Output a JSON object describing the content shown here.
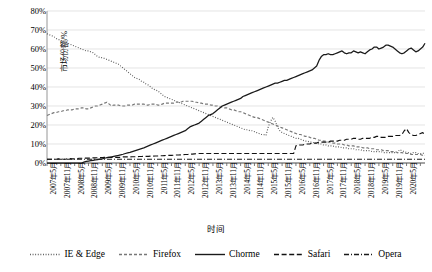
{
  "chart_data": {
    "type": "line",
    "title": "",
    "xlabel": "时间",
    "ylabel": "市场份额/%",
    "ylim": [
      0,
      80
    ],
    "ytick_labels": [
      "0%",
      "10%",
      "20%",
      "30%",
      "40%",
      "50%",
      "60%",
      "70%",
      "80%"
    ],
    "ytick_values": [
      0,
      10,
      20,
      30,
      40,
      50,
      60,
      70,
      80
    ],
    "grid": true,
    "legend_position": "bottom",
    "x_start": "2007年5月",
    "x_end": "2020年5月",
    "x_tick_interval_months": 6,
    "x_tick_labels": [
      "2007年5月",
      "2007年11月",
      "2008年5月",
      "2008年11月",
      "2009年5月",
      "2009年11月",
      "2010年5月",
      "2010年11月",
      "2011年5月",
      "2011年11月",
      "2012年5月",
      "2012年11月",
      "2013年5月",
      "2013年11月",
      "2014年5月",
      "2014年11月",
      "2015年5月",
      "2015年11月",
      "2016年5月",
      "2016年11月",
      "2017年5月",
      "2017年11月",
      "2018年5月",
      "2018年11月",
      "2019年5月",
      "2019年11月",
      "2020年5月"
    ],
    "series": [
      {
        "name": "IE & Edge",
        "style": "dotted",
        "color": "#555555",
        "values": [
          68,
          67.5,
          67,
          66.5,
          65.5,
          65,
          64.5,
          64,
          63.5,
          63,
          62.5,
          62,
          61.5,
          61,
          60.5,
          60,
          59.5,
          59,
          59,
          58.5,
          58,
          57,
          56,
          55.5,
          55.5,
          55,
          54.5,
          54,
          53.5,
          53,
          52.5,
          52,
          51,
          50,
          49,
          48,
          47,
          46,
          45,
          44.5,
          44,
          43,
          42.5,
          41.5,
          41,
          40,
          39,
          38.5,
          38,
          37,
          36,
          35,
          34.5,
          34,
          33.5,
          33,
          32.5,
          32,
          31.5,
          31,
          30.5,
          30,
          29.5,
          29,
          28.5,
          28,
          27.5,
          27,
          26.5,
          26,
          25.5,
          25,
          24.5,
          24,
          23.5,
          23,
          22.5,
          22,
          21.5,
          21,
          20.5,
          20,
          19.5,
          19,
          18.5,
          18,
          17.5,
          17.5,
          17,
          17,
          16.5,
          16,
          15.5,
          15,
          15,
          14.5,
          19,
          22,
          24,
          22,
          19,
          17,
          16,
          15.5,
          15,
          14.5,
          14,
          13.5,
          13,
          13,
          12.5,
          12,
          11.5,
          11.5,
          11,
          11,
          10.5,
          10.5,
          10,
          10,
          9.5,
          9.5,
          9,
          9,
          9,
          8.5,
          8.5,
          8.5,
          8,
          8,
          8,
          7.5,
          7.5,
          7.5,
          7,
          7,
          7,
          6.5,
          6.5,
          6.5,
          6.5,
          6,
          6,
          6,
          6,
          6,
          5.5,
          5.5,
          5.5,
          5.5,
          5.5,
          5.5,
          5.5,
          7,
          6.5,
          6,
          5.5,
          5.5,
          5,
          5.5,
          5.5,
          5,
          5,
          5,
          5.5
        ]
      },
      {
        "name": "Firefox",
        "style": "dashed-short",
        "color": "#777777",
        "values": [
          25,
          25.5,
          26,
          26.5,
          26.5,
          27,
          27,
          27.5,
          27.5,
          28,
          28,
          28,
          28.5,
          28.5,
          28.5,
          29,
          29,
          28.5,
          28.5,
          29,
          29.5,
          30,
          30,
          30.5,
          31,
          31.5,
          32,
          31,
          30,
          30.5,
          30.5,
          30.5,
          30,
          30,
          30,
          30.5,
          30.5,
          30.5,
          31,
          31,
          31,
          31,
          31,
          30.5,
          30.5,
          31,
          31,
          31,
          30.5,
          30.5,
          31,
          31.5,
          31.5,
          31.5,
          31.5,
          31.5,
          32,
          32,
          32,
          32.5,
          32.5,
          32.5,
          32.5,
          32.5,
          32,
          32,
          31.5,
          31.5,
          31,
          31,
          31,
          30.5,
          30.5,
          30,
          30,
          29.5,
          29.5,
          29,
          29,
          28.5,
          28,
          28,
          27.5,
          27,
          27,
          26.5,
          26,
          25.5,
          25,
          24.5,
          24,
          24,
          23.5,
          23,
          22.5,
          22,
          21.5,
          21,
          20.5,
          20,
          19.5,
          19,
          18.5,
          18,
          17.5,
          17,
          16.5,
          16,
          15.5,
          15,
          15,
          14.5,
          14,
          14,
          13.5,
          13,
          13,
          12.5,
          12,
          12,
          11.5,
          11.5,
          11,
          11,
          10.5,
          10.5,
          10,
          10,
          10,
          9.5,
          9.5,
          9,
          9,
          9,
          8.5,
          8.5,
          8.5,
          8,
          8,
          8,
          7.5,
          7.5,
          7.5,
          7,
          7,
          7,
          6.5,
          6.5,
          6.5,
          6,
          6,
          6,
          5.5,
          5.5,
          5.5,
          5,
          5,
          5,
          4.5,
          4.5,
          4.5,
          4.5,
          4.5,
          4,
          4
        ]
      },
      {
        "name": "Chorme",
        "style": "solid",
        "color": "#1a1a1a",
        "values": [
          0,
          0,
          0,
          0,
          0,
          0,
          0,
          0,
          0,
          0,
          0,
          0,
          0,
          0,
          0,
          0,
          0.5,
          0.8,
          1,
          1.2,
          1.4,
          1.6,
          1.8,
          2,
          2.2,
          2.5,
          2.8,
          3,
          3.2,
          3.5,
          3.8,
          4,
          4.3,
          4.6,
          5,
          5.3,
          5.6,
          6,
          6.4,
          6.8,
          7.2,
          7.6,
          8,
          8.5,
          9,
          9.5,
          10,
          10.5,
          11,
          11.5,
          12,
          12.5,
          13,
          13.5,
          14,
          14.5,
          15,
          15.5,
          16,
          16.5,
          17,
          18,
          19,
          19.5,
          20,
          20.5,
          21,
          22,
          23,
          24,
          25,
          25.5,
          26,
          27,
          28,
          29,
          30,
          30.5,
          31,
          31.5,
          32,
          32.5,
          33,
          33.5,
          34,
          35,
          35.5,
          36,
          36.5,
          37,
          37.5,
          38,
          38.5,
          39,
          39.5,
          40,
          40.5,
          41,
          41.5,
          42,
          42,
          42.5,
          43,
          43.5,
          43.5,
          44,
          44.5,
          45,
          45.5,
          46,
          46.5,
          47,
          47.5,
          48,
          48.5,
          49,
          50,
          51,
          54,
          56,
          57,
          57,
          57.5,
          57,
          57,
          57.5,
          58,
          58.5,
          59,
          58,
          57.5,
          58,
          58,
          59,
          58.5,
          58,
          58.5,
          58,
          57.5,
          58.5,
          59.5,
          60,
          61,
          61,
          60,
          60.5,
          61,
          62,
          62,
          61.5,
          61,
          60,
          59,
          58,
          57.5,
          58,
          59,
          60,
          60.5,
          59.5,
          58.5,
          59,
          60,
          61,
          63
        ]
      },
      {
        "name": "Safari",
        "style": "dashed-long",
        "color": "#111111",
        "values": [
          2,
          2,
          2,
          2,
          2,
          2.2,
          2.2,
          2,
          2,
          2.2,
          2.3,
          2.2,
          2.2,
          2.3,
          2.5,
          2.5,
          2.5,
          2.6,
          2.6,
          2.6,
          2.7,
          2.7,
          2.8,
          2.8,
          2.8,
          3,
          3,
          3,
          3,
          3,
          3,
          3,
          3,
          3.2,
          3.2,
          3.2,
          3.2,
          3.3,
          3.3,
          3.3,
          3.4,
          3.4,
          3.5,
          3.5,
          3.5,
          3.6,
          3.6,
          3.7,
          3.7,
          3.8,
          3.8,
          3.9,
          4,
          4,
          4,
          4.1,
          4.2,
          4.2,
          4.3,
          4.4,
          4.5,
          4.5,
          4.6,
          4.7,
          4.8,
          4.9,
          5,
          5,
          5,
          5,
          5,
          5,
          5,
          5,
          5,
          5,
          5,
          5,
          5,
          5,
          5,
          5,
          5,
          5,
          5,
          5,
          5,
          5,
          5,
          5,
          5,
          5,
          5,
          5,
          5,
          5,
          5,
          5,
          5,
          5,
          5,
          5,
          5,
          5,
          5,
          5,
          5,
          5,
          9,
          9.5,
          9.5,
          9.5,
          10,
          10,
          10,
          10.5,
          10.5,
          10.5,
          11,
          11,
          11,
          11,
          11,
          11.5,
          11.5,
          11.5,
          11.5,
          12,
          12,
          12,
          12.5,
          12.5,
          12.5,
          13,
          13,
          12.5,
          12.5,
          13,
          13,
          13,
          13,
          13.5,
          13.5,
          14,
          14,
          13.5,
          13.5,
          13.5,
          14,
          14,
          14,
          14.5,
          14.5,
          14.5,
          15,
          17,
          18,
          16,
          15,
          14.5,
          14.5,
          15,
          15.5,
          16,
          15
        ]
      },
      {
        "name": "Opera",
        "style": "dash-dot",
        "color": "#1a1a1a",
        "values": [
          2,
          2,
          2,
          2,
          2,
          2,
          2,
          2,
          2,
          2,
          2,
          2,
          2,
          2,
          2,
          2,
          2,
          2,
          2,
          2,
          2,
          2,
          2,
          2,
          2,
          2,
          2,
          2,
          2,
          2,
          2,
          2,
          2,
          2,
          2,
          2,
          2,
          2,
          2,
          2,
          2,
          2,
          2,
          2,
          2,
          2,
          2,
          2,
          2,
          2,
          2,
          2,
          2,
          2,
          2,
          2,
          2,
          2,
          2,
          2,
          2,
          2,
          2,
          2,
          2,
          2,
          2,
          2,
          2,
          2,
          2,
          2,
          2,
          2,
          2,
          2,
          2,
          2,
          2,
          2,
          2,
          2,
          2,
          2,
          2,
          2,
          2,
          2,
          2,
          2,
          2,
          2,
          2,
          2,
          2,
          2,
          2,
          2,
          2,
          2,
          2,
          2,
          2,
          2,
          2,
          2,
          2,
          2,
          2,
          2,
          2,
          2,
          2,
          2,
          2,
          2,
          2,
          2,
          2,
          2,
          2,
          2,
          2,
          2,
          2,
          2,
          2,
          2,
          2,
          2,
          2,
          2,
          2,
          2,
          2,
          2,
          2,
          2,
          2,
          2,
          2,
          2,
          2,
          2,
          2,
          2,
          2,
          2,
          2,
          2,
          2,
          2,
          2,
          2,
          2,
          2,
          2,
          2,
          2,
          2,
          2,
          2,
          2,
          2,
          2
        ]
      }
    ]
  }
}
